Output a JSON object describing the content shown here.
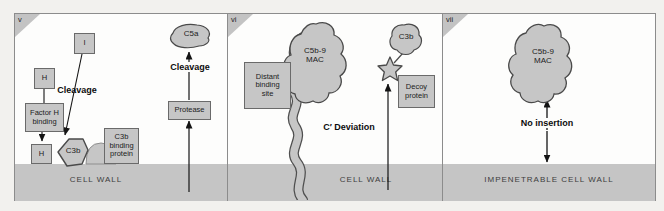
{
  "panel_v": {
    "corner": "v",
    "boxes": {
      "i": "I",
      "h": "H",
      "h_anchor": "H",
      "protease": "Protease"
    },
    "factor_h_binding": {
      "line1": "Factor H",
      "line2": "binding"
    },
    "c3b_binding_protein": {
      "line1": "C3b",
      "line2": "binding",
      "line3": "protein"
    },
    "labels": {
      "cleavage_left": "Cleavage",
      "cleavage_right": "Cleavage"
    },
    "blobs": {
      "c3b": "C3b",
      "c5a": "C5a"
    },
    "cell_wall": "CELL WALL"
  },
  "panel_vi": {
    "corner": "vi",
    "distant_binding_site": {
      "line1": "Distant",
      "line2": "binding",
      "line3": "site"
    },
    "decoy_protein": {
      "line1": "Decoy",
      "line2": "protein"
    },
    "blobs": {
      "mac_line1": "C5b-9",
      "mac_line2": "MAC",
      "c3b": "C3b"
    },
    "labels": {
      "c_deviation": "C′ Deviation"
    },
    "cell_wall": "CELL WALL"
  },
  "panel_vii": {
    "corner": "vii",
    "blobs": {
      "mac_line1": "C5b-9",
      "mac_line2": "MAC"
    },
    "labels": {
      "no_insertion": "No insertion"
    },
    "cell_wall": "IMPENETRABLE CELL WALL"
  },
  "colors": {
    "structure_gray": "#c6c6c6",
    "outline_dark": "#4a4a4a",
    "box_border": "#6a6a6a",
    "panel_border": "#8c8c8c",
    "ink": "#141414"
  }
}
